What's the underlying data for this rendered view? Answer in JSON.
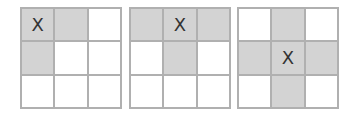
{
  "grids": [
    {
      "left": 20,
      "cells": [
        [
          "X",
          true
        ],
        [
          "",
          true
        ],
        [
          "",
          false
        ],
        [
          "",
          true
        ],
        [
          "",
          false
        ],
        [
          "",
          false
        ],
        [
          "",
          false
        ],
        [
          "",
          false
        ],
        [
          "",
          false
        ]
      ]
    },
    {
      "left": 129,
      "cells": [
        [
          "",
          true
        ],
        [
          "X",
          true
        ],
        [
          "",
          true
        ],
        [
          "",
          false
        ],
        [
          "",
          true
        ],
        [
          "",
          false
        ],
        [
          "",
          false
        ],
        [
          "",
          false
        ],
        [
          "",
          false
        ]
      ]
    },
    {
      "left": 237,
      "cells": [
        [
          "",
          false
        ],
        [
          "",
          true
        ],
        [
          "",
          false
        ],
        [
          "",
          true
        ],
        [
          "X",
          true
        ],
        [
          "",
          true
        ],
        [
          "",
          false
        ],
        [
          "",
          true
        ],
        [
          "",
          false
        ]
      ]
    }
  ],
  "colors": {
    "highlight": "#d3d3d3",
    "border": "#b0b0b0",
    "empty": "#ffffff"
  }
}
